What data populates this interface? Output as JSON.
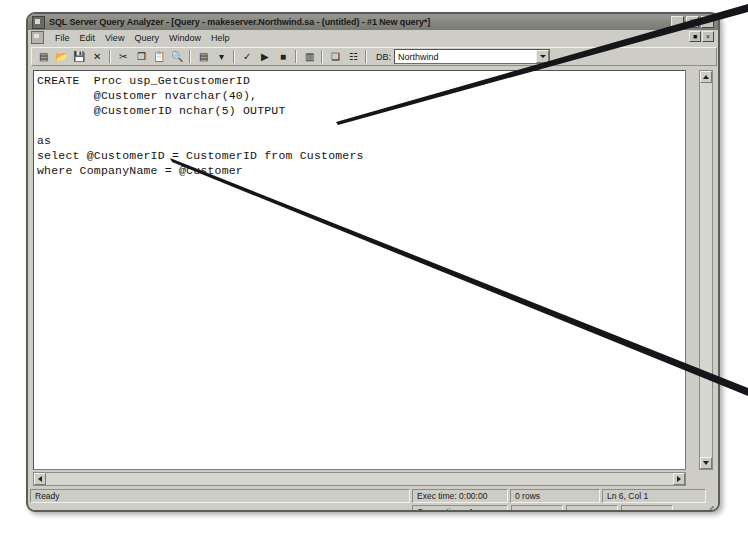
{
  "window": {
    "title": "SQL Server Query Analyzer - [Query - makeserver.Northwind.sa - (untitled) - #1 New query*]",
    "app_icon": "sql-query-analyzer-icon",
    "controls": {
      "minimize": "_",
      "maximize": "□",
      "close": "×"
    },
    "mdi_controls": {
      "restore": "■",
      "close": "×"
    }
  },
  "menubar": {
    "items": [
      {
        "label": "File"
      },
      {
        "label": "Edit"
      },
      {
        "label": "View"
      },
      {
        "label": "Query"
      },
      {
        "label": "Window"
      },
      {
        "label": "Help"
      }
    ]
  },
  "toolbar": {
    "buttons": [
      {
        "name": "new-query-button",
        "glyph": "▤"
      },
      {
        "name": "open-file-button",
        "glyph": "📂"
      },
      {
        "name": "save-query-button",
        "glyph": "💾"
      },
      {
        "name": "clear-window-button",
        "glyph": "✕"
      },
      {
        "name": "cut-button",
        "glyph": "✂"
      },
      {
        "name": "copy-button",
        "glyph": "❐"
      },
      {
        "name": "paste-button",
        "glyph": "📋"
      },
      {
        "name": "find-button",
        "glyph": "🔍"
      },
      {
        "name": "execute-mode-button",
        "glyph": "▤"
      },
      {
        "name": "execute-mode-dropdown",
        "glyph": "▾"
      },
      {
        "name": "parse-query-button",
        "glyph": "✓"
      },
      {
        "name": "execute-query-button",
        "glyph": "▶"
      },
      {
        "name": "stop-query-button",
        "glyph": "■"
      },
      {
        "name": "display-estimated-plan-button",
        "glyph": "▥"
      },
      {
        "name": "object-browser-button",
        "glyph": "❑"
      },
      {
        "name": "show-results-pane-button",
        "glyph": "☷"
      }
    ],
    "db_label": "DB:",
    "db_label_accesskey": "D",
    "db_value": "Northwind",
    "db_options": [
      "Northwind",
      "master",
      "model",
      "msdb",
      "pubs",
      "tempdb"
    ]
  },
  "editor": {
    "code": "CREATE  Proc usp_GetCustomerID\n        @Customer nvarchar(40),\n        @CustomerID nchar(5) OUTPUT\n\nas\nselect @CustomerID = CustomerID from Customers\nwhere CompanyName = @Customer",
    "vscroll": {
      "up": "▲",
      "down": "▼"
    },
    "hscroll": {
      "left": "◀",
      "right": "▶"
    }
  },
  "statusbar": {
    "ready": "Ready",
    "exec_time": "Exec time: 0:00:00",
    "rows": "0 rows",
    "position": "Ln 6, Col 1",
    "connections": "Connections: 1",
    "empty1": "",
    "empty2": "",
    "empty3": ""
  },
  "annotations": {
    "callout_output": {
      "target": "OUTPUT keyword",
      "from_x": 748,
      "from_y": 8,
      "to_x": 337,
      "to_y": 124
    },
    "callout_companyname": {
      "target": "CompanyName column",
      "from_x": 748,
      "from_y": 392,
      "to_x": 171,
      "to_y": 159
    }
  },
  "colors": {
    "window_face": "#cdcdc6",
    "titlebar": "#86867f",
    "editor_bg": "#ffffff",
    "text": "#141412",
    "border": "#5c5c58",
    "annotation_line": "#16161a"
  }
}
